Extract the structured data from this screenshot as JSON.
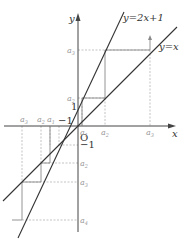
{
  "figure": {
    "origin_label": "O",
    "x_axis_label": "x",
    "y_axis_label": "y",
    "line1_label": "y=2x+1",
    "line2_label": "y=x",
    "tick_one": "1",
    "tick_neg_one_x": "−1",
    "tick_neg_one_y": "−1"
  },
  "upper_sequence": {
    "x_labels": [
      "a1",
      "a2",
      "a3"
    ],
    "y_labels": [
      "a2",
      "a3"
    ]
  },
  "lower_sequence": {
    "x_labels": [
      "a3",
      "a2",
      "a1"
    ],
    "y_labels": [
      "a2",
      "a3",
      "a4"
    ]
  },
  "labels": {
    "a1": "a",
    "a1_sub": "1",
    "a2": "a",
    "a2_sub": "2",
    "a3": "a",
    "a3_sub": "3",
    "a4": "a",
    "a4_sub": "4"
  }
}
